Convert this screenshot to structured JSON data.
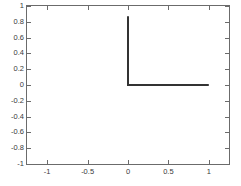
{
  "chart_data": {
    "type": "line",
    "title": "",
    "xlabel": "",
    "ylabel": "",
    "xlim": [
      -1.25,
      1.25
    ],
    "ylim": [
      -1.15,
      1.15
    ],
    "grid": false,
    "legend": null,
    "xticks": [
      -1,
      -0.5,
      0,
      0.5,
      1
    ],
    "xticklabels": [
      "-1",
      "-0.5",
      "0",
      "0.5",
      "1"
    ],
    "yticks": [
      1,
      0.8,
      0.6,
      0.4,
      0.2,
      0,
      -0.2,
      -0.4,
      -0.6,
      -0.8,
      -1
    ],
    "yticklabels": [
      "1",
      "0.8",
      "0.6",
      "0.4",
      "0.2",
      "0",
      "-0.2",
      "-0.4",
      "-0.6",
      "-0.8",
      "-1"
    ],
    "series": [
      {
        "name": "step",
        "color": "#333333",
        "linewidth": 2,
        "x": [
          0,
          0,
          1
        ],
        "y": [
          1,
          0,
          0
        ]
      }
    ],
    "colors": {
      "axis": "#6b6b6b",
      "tick_label": "#3a3a3a",
      "line": "#333333",
      "background": "#ffffff"
    }
  }
}
